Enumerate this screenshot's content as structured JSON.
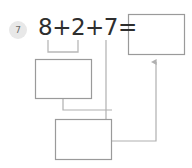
{
  "worksheet": {
    "problem_number": "7",
    "equation": "8+2+7=",
    "addends": [
      "8",
      "2",
      "7"
    ],
    "colors": {
      "badge_background": "#e8e8e8",
      "badge_text": "#6b6b6b",
      "equation_text": "#2e2e2e",
      "box_stroke": "#9a9a9a",
      "connector_stroke": "#b0b0b0",
      "page_background": "#ffffff"
    },
    "boxes": [
      {
        "id": "sum-box",
        "name": "answer-box-sum",
        "value": "",
        "x": 128,
        "y": 14,
        "width": 57,
        "height": 41
      },
      {
        "id": "first-pair-box",
        "name": "answer-box-first-pair",
        "value": "",
        "x": 35,
        "y": 59,
        "width": 57,
        "height": 40
      },
      {
        "id": "total-box",
        "name": "answer-box-total",
        "value": "",
        "x": 55,
        "y": 119,
        "width": 57,
        "height": 41
      }
    ],
    "bracket": {
      "name": "grouping-bracket",
      "spans": "8+2",
      "left_x": 48,
      "right_x": 78,
      "top_y": 40,
      "bottom_y": 52
    },
    "connectors": [
      {
        "name": "first-pair-to-total",
        "from": "answer-box-first-pair",
        "to": "answer-box-total",
        "path": "M 63 99 L 63 110 L 112 110"
      },
      {
        "name": "seven-to-total",
        "from": "addend-7",
        "to": "answer-box-total",
        "path": "M 106 40 L 106 119"
      },
      {
        "name": "total-to-sum-arrow",
        "from": "answer-box-total",
        "to": "answer-box-sum",
        "path": "M 112 141 L 156 141 L 156 60",
        "arrowhead": true
      }
    ]
  }
}
